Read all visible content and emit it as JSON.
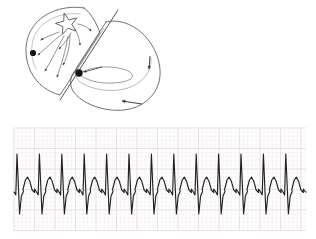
{
  "figure": {
    "title": "Atrial tachycardia with rapid ventricular response",
    "panels": [
      "heart-conduction-diagram",
      "ecg-rhythm-strip"
    ],
    "background_color": "#ffffff"
  },
  "heart_diagram": {
    "name": "heart-conduction-diagram",
    "stroke_color": "#555555",
    "marker_color": "#1a1a1a",
    "line_width": 0.8,
    "atrium": {
      "label": "atrium",
      "ectopic_focus": {
        "shape": "star",
        "points": 5,
        "cx": 67,
        "cy": 24,
        "outer_r": 11,
        "inner_r": 4.6,
        "rotation_deg": -14
      },
      "conduction_arrows": 8,
      "arrow_endpoints": [
        {
          "x": 40,
          "y": 41
        },
        {
          "x": 36,
          "y": 56
        },
        {
          "x": 44,
          "y": 72
        },
        {
          "x": 56,
          "y": 78
        },
        {
          "x": 62,
          "y": 66
        },
        {
          "x": 58,
          "y": 50
        },
        {
          "x": 80,
          "y": 46
        },
        {
          "x": 90,
          "y": 32
        }
      ],
      "sa_node_dot": {
        "x": 33,
        "y": 53,
        "r": 3.1
      }
    },
    "av_node": {
      "label": "av-node",
      "x": 79,
      "y": 73,
      "r": 3.6
    },
    "septum_line": {
      "label": "septum-divider",
      "x1": 60,
      "y1": 100,
      "x2": 118,
      "y2": 10
    },
    "ventricle": {
      "label": "ventricle",
      "reentry_loop": true,
      "apex_arrow": {
        "x": 123,
        "y": 101
      },
      "lateral_arrow": {
        "x": 148,
        "y": 70
      }
    }
  },
  "ecg_strip": {
    "name": "ecg-rhythm-strip",
    "bounds": {
      "x": 14,
      "y": 8,
      "width": 292,
      "height": 103
    },
    "paper": {
      "minor_grid_color": "#f3eaec",
      "major_grid_color": "#e9dde1",
      "minor_mm": 4.1,
      "major_mm": 20.5,
      "background": "#ffffff"
    },
    "trace": {
      "color": "#222222",
      "width": 1.15,
      "baseline_y": 64,
      "beat_count": 13,
      "beat_interval_px": 22.4,
      "first_beat_x": 17
    },
    "beat_template": {
      "p_wave": {
        "offset": -7.5,
        "amplitude": 0,
        "width": 0
      },
      "q_dip": {
        "offset": -1.2,
        "amplitude": 3
      },
      "r_peak": {
        "offset": 0,
        "amplitude": 38
      },
      "s_trough": {
        "offset": 2.6,
        "amplitude": -22
      },
      "j_point": {
        "offset": 4.4,
        "amplitude": -4
      },
      "t_wave": {
        "offset": 10.5,
        "amplitude": 15,
        "width": 7.5
      },
      "u_notch": {
        "offset": 17.5,
        "amplitude": 3
      }
    }
  },
  "chart_data": {
    "type": "line",
    "xlabel": "",
    "ylabel": "",
    "grid": true,
    "legend": "none",
    "series": [
      {
        "name": "lead-trace",
        "beats": 13,
        "r_wave_amplitudes_mm": [
          38,
          38,
          38,
          38,
          38,
          38,
          38,
          38,
          38,
          38,
          38,
          38,
          38
        ],
        "t_wave_amplitudes_mm": [
          15,
          15,
          15,
          15,
          15,
          15,
          15,
          15,
          15,
          15,
          15,
          15,
          15
        ],
        "rr_interval_px": 22.4
      }
    ]
  }
}
